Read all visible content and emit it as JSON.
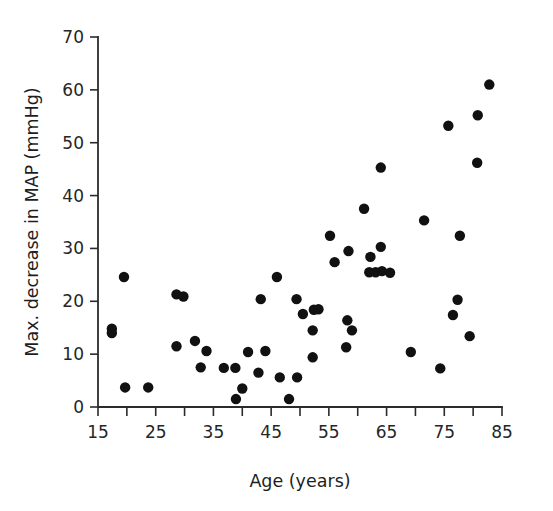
{
  "chart_data": {
    "type": "scatter",
    "title": "",
    "subtitle": "",
    "xlabel": "Age (years)",
    "ylabel": "Max. decrease in MAP (mmHg)",
    "xlim": [
      15,
      85
    ],
    "ylim": [
      0,
      70
    ],
    "xticks": [
      15,
      20,
      25,
      30,
      35,
      40,
      45,
      50,
      55,
      60,
      65,
      70,
      75,
      80,
      85
    ],
    "xtick_labels": [
      "15",
      "",
      "25",
      "",
      "35",
      "",
      "45",
      "",
      "55",
      "",
      "65",
      "",
      "75",
      "",
      "85"
    ],
    "yticks": [
      0,
      10,
      20,
      30,
      40,
      50,
      60,
      70
    ],
    "ytick_labels": [
      "0",
      "10",
      "20",
      "30",
      "40",
      "50",
      "60",
      "70"
    ],
    "grid": false,
    "legend": null,
    "legend_position": "none",
    "marker": {
      "shape": "circle",
      "color": "#111111",
      "radius_px": 5.2
    },
    "series": [
      {
        "name": "Subjects",
        "points": [
          {
            "x": 17.4,
            "y": 14.8
          },
          {
            "x": 17.4,
            "y": 14.0
          },
          {
            "x": 19.5,
            "y": 24.6
          },
          {
            "x": 19.7,
            "y": 3.7
          },
          {
            "x": 23.7,
            "y": 3.7
          },
          {
            "x": 28.6,
            "y": 21.3
          },
          {
            "x": 29.8,
            "y": 20.9
          },
          {
            "x": 28.6,
            "y": 11.5
          },
          {
            "x": 31.8,
            "y": 12.5
          },
          {
            "x": 32.8,
            "y": 7.5
          },
          {
            "x": 33.8,
            "y": 10.6
          },
          {
            "x": 36.8,
            "y": 7.4
          },
          {
            "x": 38.8,
            "y": 7.4
          },
          {
            "x": 38.9,
            "y": 1.5
          },
          {
            "x": 40.0,
            "y": 3.5
          },
          {
            "x": 41.0,
            "y": 10.4
          },
          {
            "x": 42.8,
            "y": 6.5
          },
          {
            "x": 43.2,
            "y": 20.4
          },
          {
            "x": 44.0,
            "y": 10.6
          },
          {
            "x": 46.0,
            "y": 24.6
          },
          {
            "x": 46.5,
            "y": 5.6
          },
          {
            "x": 48.1,
            "y": 1.5
          },
          {
            "x": 49.4,
            "y": 20.4
          },
          {
            "x": 49.5,
            "y": 5.6
          },
          {
            "x": 50.5,
            "y": 17.6
          },
          {
            "x": 52.2,
            "y": 14.5
          },
          {
            "x": 52.2,
            "y": 9.4
          },
          {
            "x": 52.4,
            "y": 18.4
          },
          {
            "x": 53.2,
            "y": 18.5
          },
          {
            "x": 55.2,
            "y": 32.4
          },
          {
            "x": 56.0,
            "y": 27.4
          },
          {
            "x": 58.2,
            "y": 16.4
          },
          {
            "x": 58.4,
            "y": 29.5
          },
          {
            "x": 58.0,
            "y": 11.3
          },
          {
            "x": 59.0,
            "y": 14.5
          },
          {
            "x": 61.1,
            "y": 37.5
          },
          {
            "x": 62.2,
            "y": 28.4
          },
          {
            "x": 62.0,
            "y": 25.5
          },
          {
            "x": 63.1,
            "y": 25.5
          },
          {
            "x": 64.0,
            "y": 45.3
          },
          {
            "x": 64.0,
            "y": 30.3
          },
          {
            "x": 64.2,
            "y": 25.7
          },
          {
            "x": 65.6,
            "y": 25.4
          },
          {
            "x": 69.2,
            "y": 10.4
          },
          {
            "x": 71.5,
            "y": 35.3
          },
          {
            "x": 74.3,
            "y": 7.3
          },
          {
            "x": 75.7,
            "y": 53.2
          },
          {
            "x": 76.5,
            "y": 17.4
          },
          {
            "x": 77.3,
            "y": 20.3
          },
          {
            "x": 77.7,
            "y": 32.4
          },
          {
            "x": 79.4,
            "y": 13.4
          },
          {
            "x": 80.7,
            "y": 46.2
          },
          {
            "x": 80.8,
            "y": 55.2
          },
          {
            "x": 82.8,
            "y": 61.0
          }
        ]
      }
    ]
  },
  "colors": {
    "marker": "#111111",
    "axis": "#2b2b2b",
    "text": "#1e1e1e",
    "background": "#ffffff"
  }
}
